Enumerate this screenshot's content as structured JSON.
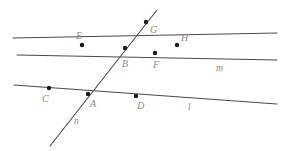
{
  "figure": {
    "type": "geometry-diagram",
    "background": "#ffffff",
    "stroke_color": "#4a4a4a",
    "point_color": "#1a1a1a",
    "label_color": "#8a8a8a",
    "width": 288,
    "height": 151,
    "lines": [
      {
        "name": "line-m-upper",
        "label": "",
        "x1": 13,
        "y1": 38,
        "x2": 277,
        "y2": 33,
        "description": "upper near-horizontal line through E, B, H"
      },
      {
        "name": "line-m",
        "label": "m",
        "x1": 17,
        "y1": 55,
        "x2": 277,
        "y2": 60,
        "label_x": 216,
        "label_y": 64,
        "description": "line m through B and F sloping down to the right"
      },
      {
        "name": "line-l",
        "label": "l",
        "x1": 14,
        "y1": 85,
        "x2": 277,
        "y2": 104,
        "label_x": 188,
        "label_y": 103,
        "description": "lower line l through C, A, D"
      },
      {
        "name": "line-n",
        "label": "n",
        "x1": 50,
        "y1": 146,
        "x2": 157,
        "y2": 10,
        "label_x": 74,
        "label_y": 117,
        "description": "steep transversal line n through A, B, G"
      }
    ],
    "points": [
      {
        "name": "point-G",
        "label": "G",
        "x": 146,
        "y": 22,
        "label_x": 150,
        "label_y": 25
      },
      {
        "name": "point-E",
        "label": "E",
        "x": 82,
        "y": 45,
        "label_x": 76,
        "label_y": 31
      },
      {
        "name": "point-H",
        "label": "H",
        "x": 177,
        "y": 45,
        "label_x": 181,
        "label_y": 33
      },
      {
        "name": "point-B",
        "label": "B",
        "x": 125,
        "y": 48,
        "label_x": 122,
        "label_y": 59
      },
      {
        "name": "point-F",
        "label": "F",
        "x": 155,
        "y": 53,
        "label_x": 153,
        "label_y": 60
      },
      {
        "name": "point-C",
        "label": "C",
        "x": 49,
        "y": 88,
        "label_x": 42,
        "label_y": 94
      },
      {
        "name": "point-A",
        "label": "A",
        "x": 88,
        "y": 94,
        "label_x": 90,
        "label_y": 99
      },
      {
        "name": "point-D",
        "label": "D",
        "x": 136,
        "y": 96,
        "label_x": 137,
        "label_y": 101
      }
    ]
  }
}
